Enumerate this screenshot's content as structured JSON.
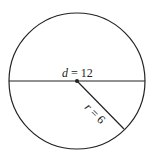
{
  "diagram": {
    "type": "circle-diameter-radius",
    "circle": {
      "cx": 77,
      "cy": 81,
      "r": 68,
      "stroke": "#222222"
    },
    "diameter": {
      "var": "d",
      "eq": " = 12",
      "value": 12
    },
    "radius": {
      "var": "r",
      "eq": " = 6",
      "value": 6,
      "end_x": 124,
      "end_y": 129
    },
    "center_point": {
      "x": 77,
      "y": 81
    }
  }
}
